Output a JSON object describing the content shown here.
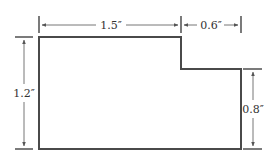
{
  "diagram": {
    "type": "dimensioned-shape",
    "shape": "L-shaped (stepped) rectangle",
    "colors": {
      "outline": "#4a4a4a",
      "dimension_line": "#555555",
      "text": "#333333",
      "background": "#ffffff"
    },
    "dimensions": {
      "top_left_width": "1.5″",
      "top_right_width": "0.6″",
      "left_height": "1.2″",
      "right_height": "0.8″"
    }
  }
}
